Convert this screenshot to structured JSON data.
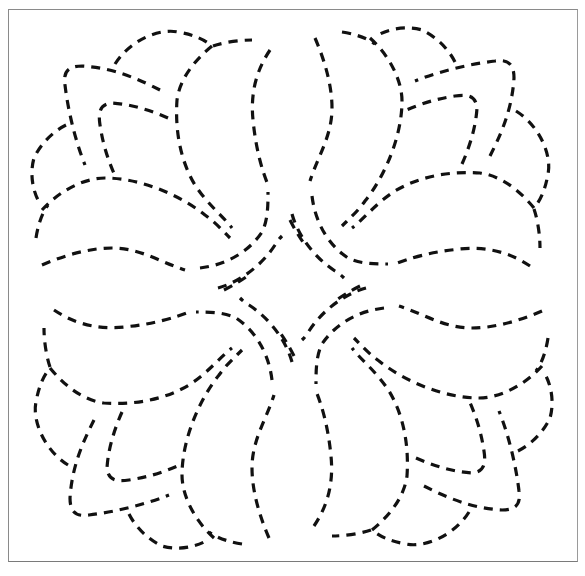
{
  "title": "Quilting stencil: four-fold dashed floral / leaf motif",
  "colors": {
    "background": "#ffffff",
    "stroke": "#111111",
    "frame": "#8a8a8a"
  },
  "pattern": {
    "symmetry": "4-fold rotational",
    "center": [
      292,
      288
    ],
    "line_style": "dashed"
  }
}
